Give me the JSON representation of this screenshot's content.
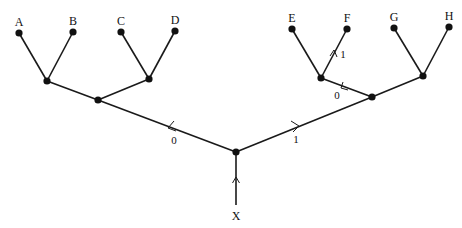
{
  "diagram": {
    "type": "binary-tree",
    "root_label": "X",
    "leaves": [
      "A",
      "B",
      "C",
      "D",
      "E",
      "F",
      "G",
      "H"
    ],
    "edge_labels": {
      "root_left": "0",
      "root_right": "1",
      "right_mid_to_ef": "0",
      "ef_to_f": "1"
    },
    "highlighted_path": [
      "X",
      "1",
      "0",
      "1",
      "F"
    ]
  }
}
